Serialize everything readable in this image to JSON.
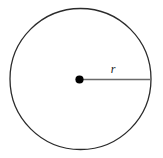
{
  "figure": {
    "type": "geometry-diagram",
    "canvas": {
      "width": 163,
      "height": 158,
      "background_color": "#ffffff"
    },
    "circle": {
      "name": "circle-outline",
      "center_x": 80.5,
      "center_y": 79,
      "radius": 70.5,
      "stroke_color": "#2b2b2b",
      "stroke_width": 1.3,
      "fill": "none"
    },
    "center_point": {
      "name": "center-dot",
      "x": 79.5,
      "y": 79.5,
      "dot_radius": 4.1,
      "fill_color": "#000000"
    },
    "radius_segment": {
      "name": "radius-line",
      "x1": 79.5,
      "y1": 79.5,
      "x2": 150.5,
      "y2": 79.5,
      "stroke_color": "#6a6a6a",
      "stroke_width": 1.6
    },
    "labels": [
      {
        "name": "radius-label",
        "text": "r",
        "x": 113,
        "y": 73,
        "font_size": 12,
        "color": "#1a1a1a",
        "style": "italic"
      }
    ]
  }
}
